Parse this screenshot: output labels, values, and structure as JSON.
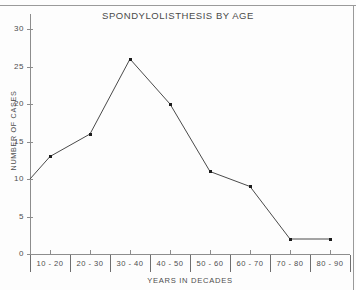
{
  "chart_data": {
    "type": "line",
    "title": "SPONDYLOLISTHESIS BY AGE",
    "xlabel": "YEARS IN DECADES",
    "ylabel": "NUMBER OF CASES",
    "categories": [
      "10 - 20",
      "20 - 30",
      "30 - 40",
      "40 - 50",
      "50 - 60",
      "60 - 70",
      "70 - 80",
      "80 - 90"
    ],
    "values": [
      13,
      16,
      26,
      20,
      11,
      9,
      2,
      2
    ],
    "origin_value": 10,
    "ylim": [
      0,
      32
    ],
    "yticks": [
      0,
      5,
      10,
      15,
      20,
      25,
      30
    ],
    "ytick_labels": [
      "0",
      "5",
      "10",
      "15",
      "20",
      "25",
      "30"
    ],
    "grid": false,
    "legend": "none",
    "line_color": "#4a4a4a",
    "marker_color": "#1d1d1d"
  },
  "figure": {
    "background_color": "#fdfdfd",
    "axis_color": "#8d8d8d"
  }
}
